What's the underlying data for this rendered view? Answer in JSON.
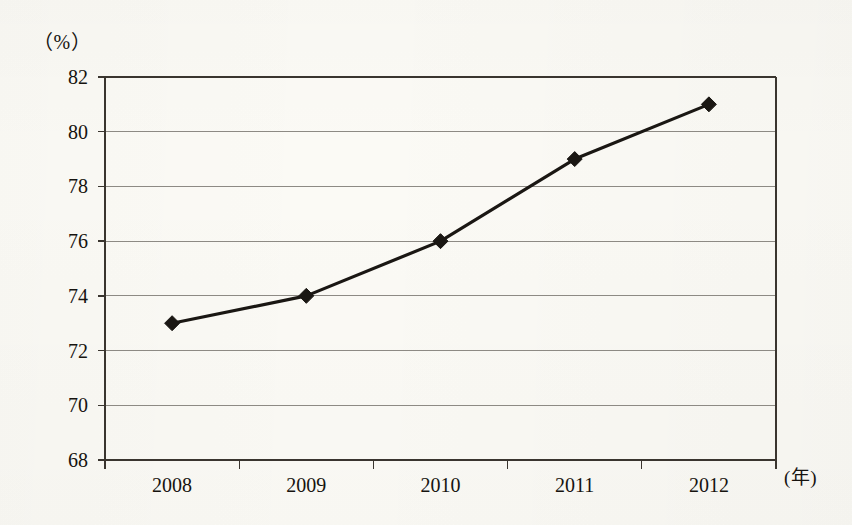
{
  "chart_data": {
    "type": "line",
    "title": "",
    "subtitle": "",
    "xlabel": "(年)",
    "ylabel": "（%）",
    "categories": [
      "2008",
      "2009",
      "2010",
      "2011",
      "2012"
    ],
    "values": [
      73,
      74,
      76,
      79,
      81
    ],
    "series": [
      {
        "name": "",
        "values": [
          73,
          74,
          76,
          79,
          81
        ]
      }
    ],
    "ylim": [
      68,
      82
    ],
    "yticks": [
      68,
      70,
      72,
      74,
      76,
      78,
      80,
      82
    ],
    "ytick_labels": [
      "68",
      "70",
      "72",
      "74",
      "76",
      "78",
      "80",
      "82"
    ],
    "xtick_labels": [
      "2008",
      "2009",
      "2010",
      "2011",
      "2012"
    ],
    "grid": true,
    "grid_axis": "y",
    "legend": false,
    "legend_position": "none",
    "marker": "diamond",
    "line_color": "#1a1713",
    "grid_color": "#8d8a84",
    "axis_color": "#3a352f",
    "text_color": "#16130f",
    "background_color": "#fbfaf5",
    "annotations": []
  },
  "axes": {
    "y_unit": "（%）",
    "x_unit": "(年)"
  }
}
